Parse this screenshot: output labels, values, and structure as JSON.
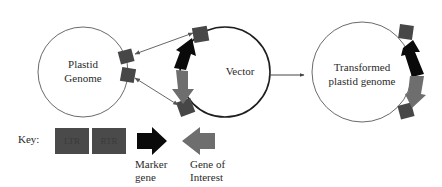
{
  "diagram": {
    "nodes": {
      "plastid_genome": {
        "label_line1": "Plastid",
        "label_line2": "Genome"
      },
      "vector": {
        "label": "Vector"
      },
      "transformed": {
        "label_line1": "Transformed",
        "label_line2": "plastid genome"
      }
    },
    "key": {
      "title": "Key:",
      "ltr": "LTR",
      "rtr": "RTR",
      "marker_line1": "Marker",
      "marker_line2": "gene",
      "goi_line1": "Gene of",
      "goi_line2": "Interest"
    },
    "colors": {
      "flank": "#474747",
      "marker": "#0a0a0a",
      "gene_of_interest": "#6e6e6e",
      "circle_stroke": "#6a6a6a",
      "vector_stroke": "#1e1e1e"
    }
  }
}
